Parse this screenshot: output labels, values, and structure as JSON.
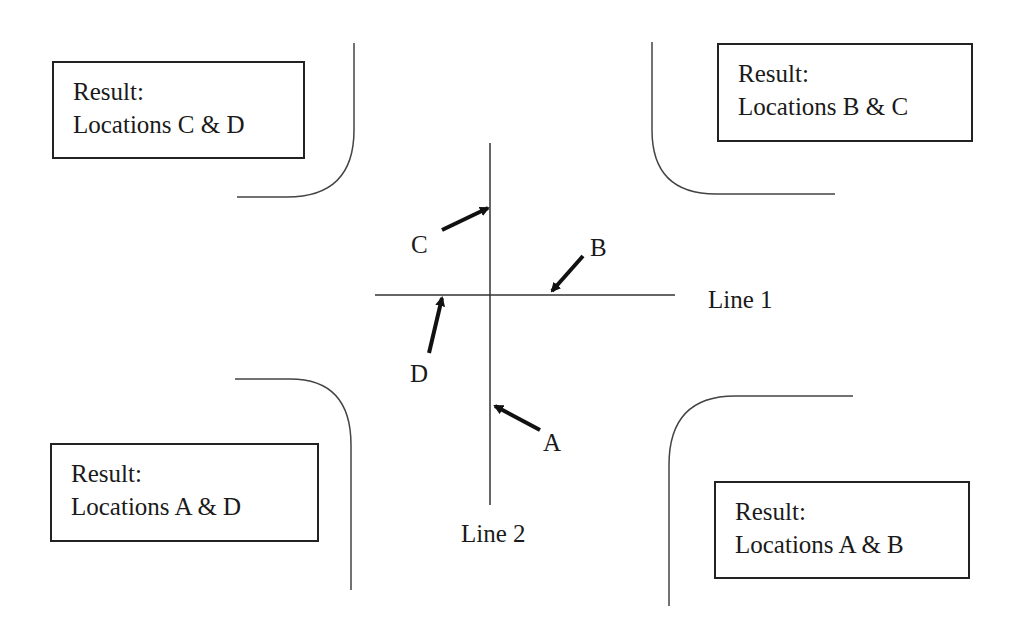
{
  "result_boxes": {
    "top_left": {
      "heading": "Result:",
      "text": "Locations C & D"
    },
    "top_right": {
      "heading": "Result:",
      "text": "Locations B & C"
    },
    "bottom_left": {
      "heading": "Result:",
      "text": "Locations A & D"
    },
    "bottom_right": {
      "heading": "Result:",
      "text": "Locations A & B"
    }
  },
  "lines": {
    "line1": "Line 1",
    "line2": "Line 2"
  },
  "locations": {
    "a": "A",
    "b": "B",
    "c": "C",
    "d": "D"
  },
  "colors": {
    "stroke": "#333333",
    "text": "#1a1a1a",
    "background": "#ffffff"
  }
}
